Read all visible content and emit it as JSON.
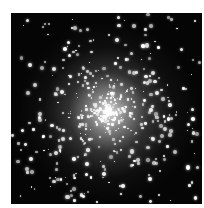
{
  "image": {
    "subject": "globular star cluster",
    "background_color": "#050505",
    "frame_color": "#ffffff",
    "star_color": "#ffffff",
    "core_center_pct": [
      51,
      52
    ]
  }
}
